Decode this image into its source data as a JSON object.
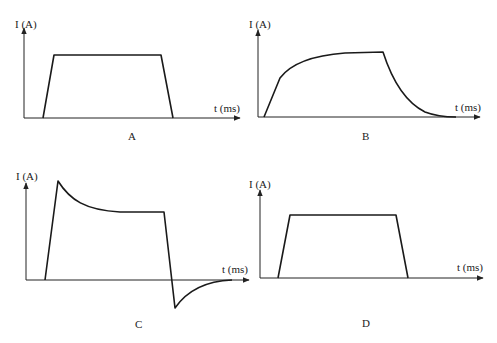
{
  "panels": [
    {
      "id": "A",
      "caption": "A",
      "ylabel": "I (A)",
      "xlabel": "t (ms)",
      "shape": "trapezoid",
      "description": "Linear rise, flat plateau, linear fall to zero"
    },
    {
      "id": "B",
      "caption": "B",
      "ylabel": "I (A)",
      "xlabel": "t (ms)",
      "shape": "exponential-rise-decay",
      "description": "Exponential rise to plateau, then exponential decay to zero"
    },
    {
      "id": "C",
      "caption": "C",
      "ylabel": "I (A)",
      "xlabel": "t (ms)",
      "shape": "overshoot-undershoot",
      "description": "Sharp rise to peak, decay to plateau, sharp fall below zero, then recovery to zero"
    },
    {
      "id": "D",
      "caption": "D",
      "ylabel": "I (A)",
      "xlabel": "t (ms)",
      "shape": "trapezoid",
      "description": "Linear rise, flat plateau, linear fall to zero"
    }
  ],
  "colors": {
    "line": "#1a1a1a",
    "background": "#ffffff"
  }
}
